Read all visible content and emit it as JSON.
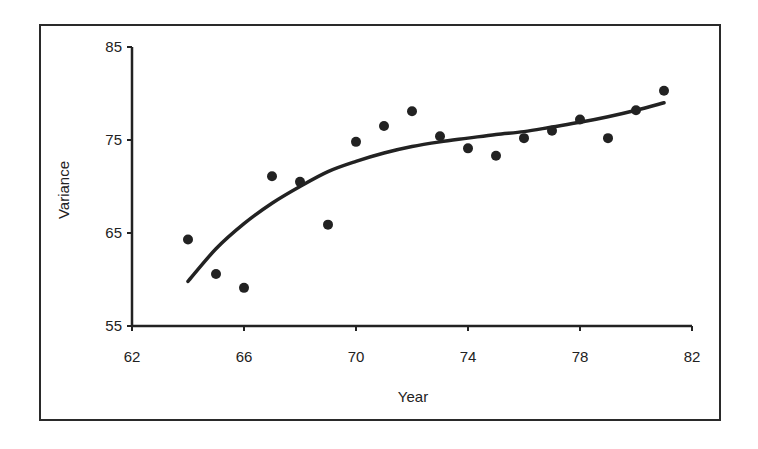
{
  "chart_data": {
    "type": "scatter",
    "title": "",
    "xlabel": "Year",
    "ylabel": "Variance",
    "xlim": [
      62,
      82
    ],
    "ylim": [
      55,
      85
    ],
    "x_ticks": [
      62,
      66,
      70,
      74,
      78,
      82
    ],
    "y_ticks": [
      55,
      65,
      75,
      85
    ],
    "grid": false,
    "legend": null,
    "series": [
      {
        "name": "Observed",
        "kind": "scatter",
        "x": [
          64,
          65,
          66,
          67,
          68,
          69,
          70,
          71,
          72,
          73,
          74,
          75,
          76,
          77,
          78,
          79,
          80,
          81
        ],
        "y": [
          64.3,
          60.6,
          59.1,
          71.1,
          70.5,
          65.9,
          74.8,
          76.5,
          78.1,
          75.4,
          74.1,
          73.3,
          75.2,
          76.0,
          77.2,
          75.2,
          78.2,
          80.3
        ]
      },
      {
        "name": "Fitted trend",
        "kind": "line",
        "x": [
          64,
          65,
          66,
          67,
          68,
          69,
          70,
          71,
          72,
          73,
          74,
          75,
          76,
          77,
          78,
          79,
          80,
          81
        ],
        "y": [
          59.8,
          63.3,
          66.0,
          68.2,
          70.0,
          71.6,
          72.7,
          73.6,
          74.3,
          74.8,
          75.2,
          75.6,
          75.9,
          76.4,
          76.9,
          77.5,
          78.2,
          79.0
        ]
      }
    ]
  },
  "labels": {
    "x_axis_title": "Year",
    "y_axis_title": "Variance",
    "x_tick_labels": [
      "62",
      "66",
      "70",
      "74",
      "78",
      "82"
    ],
    "y_tick_labels": [
      "55",
      "65",
      "75",
      "85"
    ]
  },
  "colors": {
    "ink": "#222222",
    "background": "#ffffff"
  }
}
